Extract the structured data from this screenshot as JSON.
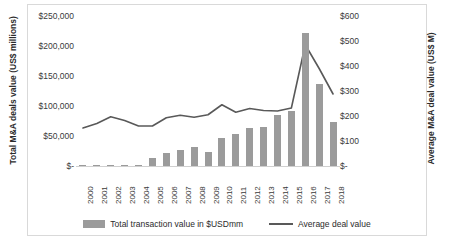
{
  "chart_data": {
    "type": "bar",
    "title": "",
    "xlabel": "",
    "categories": [
      "2000",
      "2001",
      "2002",
      "2003",
      "2004",
      "2005",
      "2006",
      "2007",
      "2008",
      "2009",
      "2010",
      "2011",
      "2012",
      "2013",
      "2014",
      "2015",
      "2016",
      "2017",
      "2018"
    ],
    "grid": false,
    "legend_position": "bottom",
    "series": [
      {
        "name": "Total transaction value in $USDmm",
        "type": "bar",
        "axis": "left",
        "color": "#9b9b9b",
        "values": [
          1500,
          1500,
          2000,
          1500,
          2000,
          14000,
          22000,
          27000,
          31000,
          24000,
          46000,
          53000,
          63000,
          65000,
          85000,
          92000,
          221000,
          136000,
          73000
        ]
      },
      {
        "name": "Average deal value",
        "type": "line",
        "axis": "right",
        "color": "#595959",
        "values": [
          152,
          170,
          197,
          182,
          160,
          160,
          193,
          203,
          195,
          205,
          245,
          215,
          230,
          222,
          220,
          232,
          485,
          390,
          288
        ]
      }
    ],
    "axes": {
      "left": {
        "label": "Total M&A deals value (US$ millions)",
        "ticks": [
          "$250,000",
          "$200,000",
          "$150,000",
          "$100,000",
          "$50,000",
          "$-"
        ],
        "min": 0,
        "max": 250000
      },
      "right": {
        "label": "Average M&A deal value (US$ M)",
        "ticks": [
          "$600",
          "$500",
          "$400",
          "$300",
          "$200",
          "$100",
          "$-"
        ],
        "min": 0,
        "max": 600
      }
    }
  },
  "legend": {
    "bars_label": "Total transaction value in $USDmm",
    "line_label": "Average deal value"
  }
}
